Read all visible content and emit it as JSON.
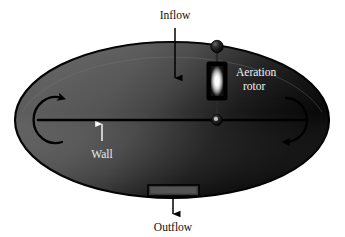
{
  "figure": {
    "name": "oxidation-ditch-schematic",
    "background_color": "#ffffff",
    "labels": {
      "inflow": "Inflow",
      "outflow": "Outflow",
      "wall": "Wall",
      "aeration_rotor_line1": "Aeration",
      "aeration_rotor_line2": "rotor"
    },
    "colors": {
      "basin_light": "#606060",
      "basin_mid": "#4e4e4e",
      "basin_dark": "#1b1b1b",
      "basin_darkest": "#0a0a0a",
      "outline": "#000000",
      "label_dark": "#111111",
      "label_light": "#f2f2f2",
      "rotor_body": "#000000",
      "rotor_glow": "#ffffff",
      "knob": "#151515"
    },
    "elements": {
      "basin": "elliptical-basin",
      "center_wall": "horizontal-center-wall",
      "inflow_arrow": "downward-arrow",
      "outflow_weir": "rectangular-weir-box",
      "outflow_arrow": "downward-arrow",
      "wall_arrow": "upward-arrow",
      "left_circulation_arrow": "curved-arrow-c-shape",
      "right_circulation_arrow": "curved-arrow-reverse-c-shape",
      "rotor": "vertical-rotor-with-glow",
      "rotor_shaft": "vertical-shaft",
      "rotor_knob_top": "sphere-knob",
      "rotor_knob_bottom": "sphere-knob"
    }
  }
}
